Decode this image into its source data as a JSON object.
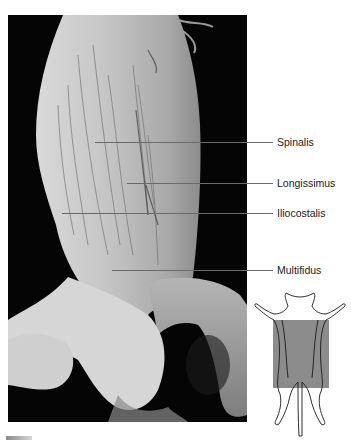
{
  "figure": {
    "labels": [
      {
        "text": "Spinalis",
        "line_y": 142,
        "line_x_start": 95,
        "text_x": 277
      },
      {
        "text": "Longissimus",
        "line_y": 183,
        "line_x_start": 127,
        "text_x": 277
      },
      {
        "text": "Iliocostalis",
        "line_y": 213,
        "line_x_start": 62,
        "text_x": 277
      },
      {
        "text": "Multifidus",
        "line_y": 270,
        "line_x_start": 112,
        "text_x": 277
      }
    ],
    "orientation_diagram": {
      "description": "cat body outline with shaded region",
      "shade_color": "#8c8c8c"
    }
  },
  "colors": {
    "background": "#ffffff",
    "photo_background": "#050505",
    "tissue": "#c9c9c9",
    "leader_line": "#6a6a6a",
    "label_text": "#1a1a1a"
  }
}
